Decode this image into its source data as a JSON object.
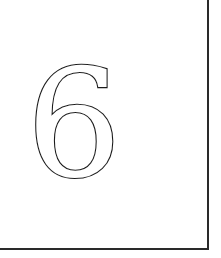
{
  "card": {
    "digit": "6",
    "border_color": "#2a2a2a",
    "digit_stroke_color": "#1a1a1a",
    "background": "#ffffff"
  }
}
